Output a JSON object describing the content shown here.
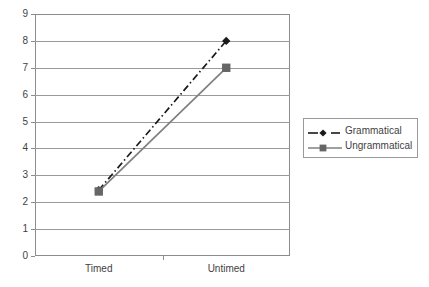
{
  "chart_data": {
    "type": "line",
    "title": "",
    "subtitle": "",
    "xlabel": "",
    "ylabel": "",
    "categories": [
      "Timed",
      "Untimed"
    ],
    "series": [
      {
        "name": "Grammatical",
        "values": [
          2.45,
          8.0
        ],
        "color": "#1a1a1a",
        "line_style": "dash-dot",
        "marker": "diamond"
      },
      {
        "name": "Ungrammatical",
        "values": [
          2.4,
          7.0
        ],
        "color": "#808080",
        "line_style": "solid",
        "marker": "square"
      }
    ],
    "ylim": [
      0,
      9
    ],
    "yticks": [
      0,
      1,
      2,
      3,
      4,
      5,
      6,
      7,
      8,
      9
    ],
    "ytick_labels": [
      "0",
      "1",
      "2",
      "3",
      "4",
      "5",
      "6",
      "7",
      "8",
      "9"
    ],
    "grid": "horizontal",
    "legend_position": "right",
    "legend_entries": [
      "Grammatical",
      "Ungrammatical"
    ],
    "annotations": []
  },
  "colors": {
    "background": "#ffffff",
    "axis": "#8c8c8c",
    "grid": "#9a9a9a",
    "text": "#3f3f3f",
    "series_grammatical": "#1a1a1a",
    "series_ungrammatical": "#808080",
    "marker_ungrammatical": "#666666",
    "legend_border": "#9a9a9a"
  }
}
